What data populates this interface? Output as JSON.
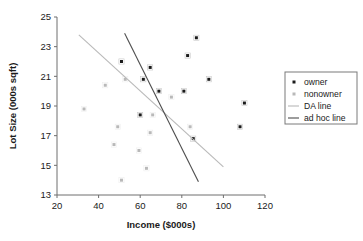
{
  "chart_data": {
    "type": "scatter",
    "title": "",
    "xlabel": "Income ($000s)",
    "ylabel": "Lot Size (000s sqft)",
    "xlim": [
      20,
      120
    ],
    "ylim": [
      13,
      25
    ],
    "xticks": [
      20,
      40,
      60,
      80,
      100,
      120
    ],
    "yticks": [
      13,
      15,
      17,
      19,
      21,
      23,
      25
    ],
    "grid": false,
    "legend_position": "right",
    "series": [
      {
        "name": "owner",
        "marker": "square-dot",
        "color": "#1a1a1a",
        "points": [
          {
            "x": 60.0,
            "y": 18.4
          },
          {
            "x": 85.5,
            "y": 16.8
          },
          {
            "x": 64.8,
            "y": 21.6
          },
          {
            "x": 61.5,
            "y": 20.8
          },
          {
            "x": 87.0,
            "y": 23.6
          },
          {
            "x": 110.1,
            "y": 19.2
          },
          {
            "x": 108.0,
            "y": 17.6
          },
          {
            "x": 82.8,
            "y": 22.4
          },
          {
            "x": 69.0,
            "y": 20.0
          },
          {
            "x": 93.0,
            "y": 20.8
          },
          {
            "x": 51.0,
            "y": 22.0
          },
          {
            "x": 81.0,
            "y": 20.0
          }
        ]
      },
      {
        "name": "nonowner",
        "marker": "square-dot",
        "color": "#b9b9b9",
        "points": [
          {
            "x": 75.0,
            "y": 19.6
          },
          {
            "x": 52.8,
            "y": 20.8
          },
          {
            "x": 64.8,
            "y": 17.2
          },
          {
            "x": 43.2,
            "y": 20.4
          },
          {
            "x": 84.0,
            "y": 17.6
          },
          {
            "x": 49.2,
            "y": 17.6
          },
          {
            "x": 59.4,
            "y": 16.0
          },
          {
            "x": 66.0,
            "y": 18.4
          },
          {
            "x": 47.4,
            "y": 16.4
          },
          {
            "x": 33.0,
            "y": 18.8
          },
          {
            "x": 51.0,
            "y": 14.0
          },
          {
            "x": 63.0,
            "y": 14.8
          }
        ]
      }
    ],
    "lines": [
      {
        "name": "DA line",
        "color": "#b9b9b9",
        "x0": 30.5,
        "y0": 23.8,
        "x1": 100.0,
        "y1": 14.9
      },
      {
        "name": "ad hoc line",
        "color": "#4d4d4d",
        "x0": 52.5,
        "y0": 23.9,
        "x1": 88.0,
        "y1": 13.9
      }
    ]
  },
  "legend": {
    "entries": [
      {
        "label": "owner",
        "kind": "marker",
        "color": "#1a1a1a"
      },
      {
        "label": "nonowner",
        "kind": "marker",
        "color": "#b9b9b9"
      },
      {
        "label": "DA line",
        "kind": "line",
        "color": "#b9b9b9"
      },
      {
        "label": "ad hoc line",
        "kind": "line",
        "color": "#4d4d4d"
      }
    ]
  }
}
